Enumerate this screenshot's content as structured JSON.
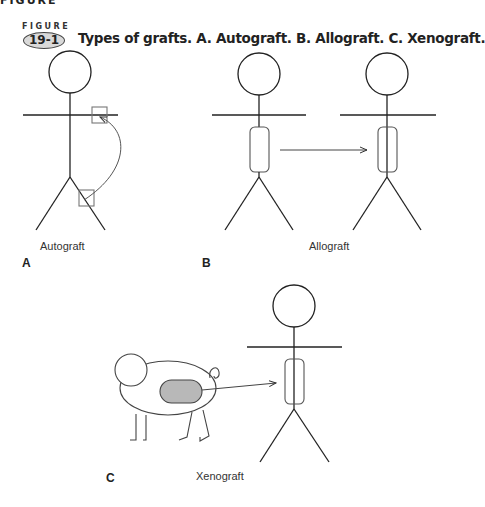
{
  "figure": {
    "cut_header": "FIGURE",
    "label_word": "FIGURE",
    "number": "19-1",
    "caption": "Types of grafts. A. Autograft. B. Allograft. C. Xenograft."
  },
  "panels": [
    {
      "letter": "A",
      "label": "Autograft"
    },
    {
      "letter": "B",
      "label": "Allograft"
    },
    {
      "letter": "C",
      "label": "Xenograft"
    }
  ],
  "colors": {
    "line": "#222222",
    "graft_fill": "#b8b8b8",
    "box": "#777777"
  }
}
